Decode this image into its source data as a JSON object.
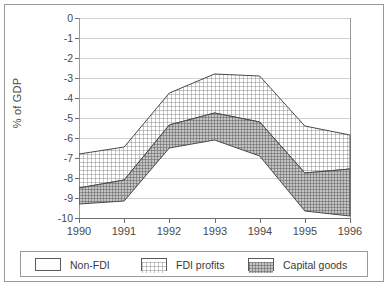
{
  "chart_data": {
    "type": "area",
    "title": "",
    "xlabel": "",
    "ylabel": "% of GDP",
    "x": [
      1990,
      1991,
      1992,
      1993,
      1994,
      1995,
      1996
    ],
    "categories": [
      "1990",
      "1991",
      "1992",
      "1993",
      "1994",
      "1995",
      "1996"
    ],
    "xlim": [
      1990,
      1996
    ],
    "ylim": [
      -10,
      0
    ],
    "ytick_labels": [
      "0",
      "-1",
      "-2",
      "-3",
      "-4",
      "-5",
      "-6",
      "-7",
      "-8",
      "-9",
      "-10"
    ],
    "ytick_values": [
      0,
      -1,
      -2,
      -3,
      -4,
      -5,
      -6,
      -7,
      -8,
      -9,
      -10
    ],
    "grid": true,
    "legend_position": "bottom",
    "stacking": "cumulative-boundaries",
    "series": [
      {
        "name": "Non-FDI",
        "swatch": "blank-white",
        "boundary_note": "upper edge of shaded band (cumulative Non-FDI level)",
        "values": [
          -6.8,
          -6.45,
          -3.75,
          -2.8,
          -2.9,
          -5.4,
          -5.85
        ]
      },
      {
        "name": "FDI profits",
        "swatch": "fine-crosshatch",
        "boundary_note": "lower edge of FDI profits band (Non-FDI + FDI profits)",
        "values": [
          -8.5,
          -8.1,
          -5.35,
          -4.75,
          -5.2,
          -7.75,
          -7.55
        ]
      },
      {
        "name": "Capital goods",
        "swatch": "dense-dark-hatch",
        "boundary_note": "lower edge of Capital goods band (total)",
        "values": [
          -9.3,
          -9.15,
          -6.5,
          -6.1,
          -6.9,
          -9.65,
          -9.9
        ]
      }
    ],
    "band_extents": {
      "fdi_profits_band": {
        "top": [
          -6.8,
          -6.45,
          -3.75,
          -2.8,
          -2.9,
          -5.4,
          -5.85
        ],
        "bottom": [
          -8.5,
          -8.1,
          -5.35,
          -4.75,
          -5.2,
          -7.75,
          -7.55
        ]
      },
      "capital_goods_band": {
        "top": [
          -8.5,
          -8.1,
          -5.35,
          -4.75,
          -5.2,
          -7.75,
          -7.55
        ],
        "bottom": [
          -9.3,
          -9.15,
          -6.5,
          -6.1,
          -6.9,
          -9.65,
          -9.9
        ]
      }
    },
    "colors": {
      "axis": "#6f6f6f",
      "grid": "#d2d2d2",
      "frame": "#9a9a9a",
      "fdi_profits_fill": "#d9d9d9",
      "capital_goods_fill": "#9e9e9e",
      "text": "#3a3a3a"
    }
  },
  "legend": {
    "items": [
      {
        "label": "Non-FDI"
      },
      {
        "label": "FDI profits"
      },
      {
        "label": "Capital goods"
      }
    ]
  }
}
